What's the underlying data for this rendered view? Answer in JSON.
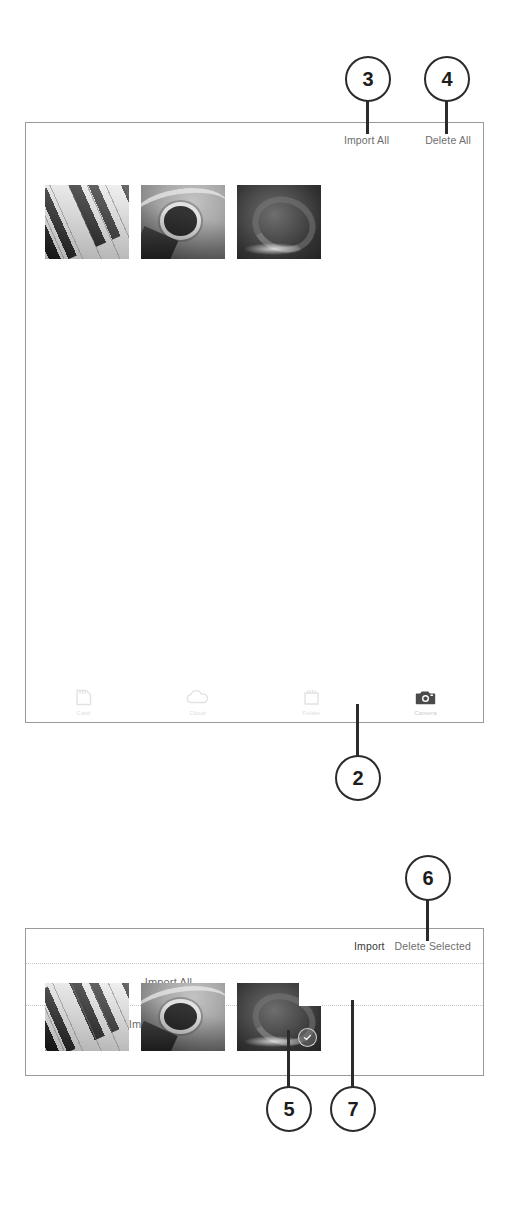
{
  "top_panel": {
    "toolbar": {
      "import_all_label": "Import All",
      "delete_all_label": "Delete All"
    },
    "thumbnails": [
      {
        "name": "piano-keys-photo",
        "selected": false
      },
      {
        "name": "acoustic-guitar-photo",
        "selected": false
      },
      {
        "name": "dark-closeup-photo",
        "selected": false
      }
    ],
    "tabbar": [
      {
        "icon": "sd-card-icon",
        "label": "Card",
        "active": false
      },
      {
        "icon": "cloud-icon",
        "label": "Cloud",
        "active": false
      },
      {
        "icon": "folder-icon",
        "label": "Folder",
        "active": false
      },
      {
        "icon": "camera-icon",
        "label": "Camera",
        "active": true
      }
    ]
  },
  "bottom_panel": {
    "toolbar": {
      "import_label": "Import",
      "delete_selected_label": "Delete Selected"
    },
    "menu": {
      "import_all_label": "Import All",
      "import_selected_label": "Import Selected"
    },
    "thumbnails": [
      {
        "name": "piano-keys-photo",
        "selected": false
      },
      {
        "name": "acoustic-guitar-photo",
        "selected": false
      },
      {
        "name": "dark-closeup-photo",
        "selected": true
      }
    ]
  },
  "callouts": [
    {
      "id": "callout-2",
      "number": "2"
    },
    {
      "id": "callout-3",
      "number": "3"
    },
    {
      "id": "callout-4",
      "number": "4"
    },
    {
      "id": "callout-5",
      "number": "5"
    },
    {
      "id": "callout-6",
      "number": "6"
    },
    {
      "id": "callout-7",
      "number": "7"
    }
  ],
  "colors": {
    "callout_stroke": "#2b2b2b",
    "panel_border": "#9a9a9a",
    "toolbar_text": "#6d6d6d",
    "menu_text": "#6a6a6a"
  }
}
